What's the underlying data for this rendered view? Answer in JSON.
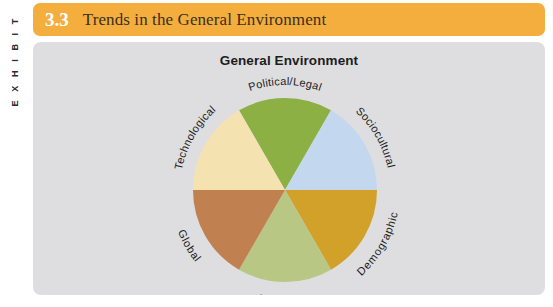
{
  "rail": {
    "label": "E X H I B I T"
  },
  "header": {
    "number": "3.3",
    "title": "Trends in the General Environment",
    "bar_color": "#F4AE3D",
    "number_color": "#FFFFFF",
    "title_color": "#3B2F22"
  },
  "panel": {
    "background": "#DEDEE0"
  },
  "chart_data": {
    "type": "pie",
    "title": "General Environment",
    "xlabel": "",
    "ylabel": "",
    "legend_position": "none",
    "grid": false,
    "equal_slices": true,
    "slice_angle_degrees": 60,
    "categories": [
      "Political/Legal",
      "Sociocultural",
      "Demographic",
      "Economic",
      "Global",
      "Technological"
    ],
    "values": [
      16.67,
      16.67,
      16.67,
      16.67,
      16.67,
      16.67
    ],
    "colors": [
      "#8CB044",
      "#C3D8EE",
      "#D2A12A",
      "#B9C785",
      "#C08050",
      "#F4E3B0"
    ],
    "slices": [
      {
        "label": "Political/Legal",
        "value": 16.67,
        "color": "#8CB044",
        "start_deg": -30,
        "end_deg": 30
      },
      {
        "label": "Sociocultural",
        "value": 16.67,
        "color": "#C3D8EE",
        "start_deg": 30,
        "end_deg": 90
      },
      {
        "label": "Demographic",
        "value": 16.67,
        "color": "#D2A12A",
        "start_deg": 90,
        "end_deg": 150
      },
      {
        "label": "Economic",
        "value": 16.67,
        "color": "#B9C785",
        "start_deg": 150,
        "end_deg": 210
      },
      {
        "label": "Global",
        "value": 16.67,
        "color": "#C08050",
        "start_deg": 210,
        "end_deg": 270
      },
      {
        "label": "Technological",
        "value": 16.67,
        "color": "#F4E3B0",
        "start_deg": 270,
        "end_deg": 330
      }
    ]
  }
}
